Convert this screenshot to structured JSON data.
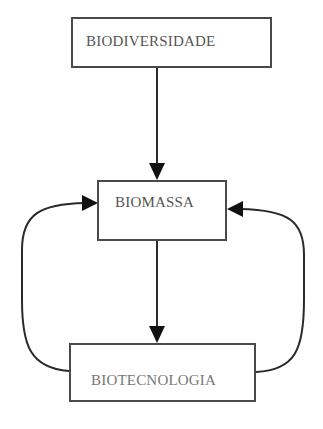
{
  "diagram": {
    "nodes": [
      {
        "id": "biodiversidade",
        "label": "BIODIVERSIDADE"
      },
      {
        "id": "biomassa",
        "label": "BIOMASSA"
      },
      {
        "id": "biotecnologia",
        "label": "BIOTECNOLOGIA"
      }
    ],
    "edges": [
      {
        "from": "biodiversidade",
        "to": "biomassa"
      },
      {
        "from": "biomassa",
        "to": "biotecnologia"
      },
      {
        "from": "biotecnologia",
        "to": "biomassa",
        "side": "left"
      },
      {
        "from": "biotecnologia",
        "to": "biomassa",
        "side": "right"
      }
    ],
    "colors": {
      "line": "#2a2a2a",
      "text": "#555555",
      "background": "#ffffff"
    }
  }
}
